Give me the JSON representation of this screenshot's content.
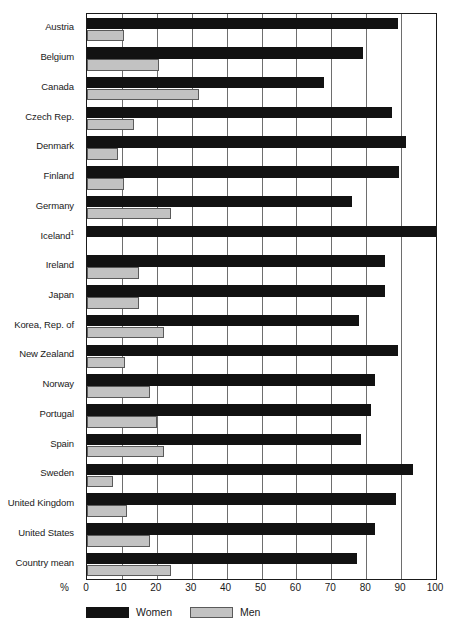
{
  "chart_data": {
    "type": "bar",
    "orientation": "horizontal",
    "title": "",
    "xlabel": "%",
    "ylabel": "",
    "xlim": [
      0,
      100
    ],
    "xticks": [
      0,
      10,
      20,
      30,
      40,
      50,
      60,
      70,
      80,
      90,
      100
    ],
    "xtick_labels": [
      "0",
      "10",
      "20",
      "30",
      "40",
      "50",
      "60",
      "70",
      "80",
      "90",
      "100"
    ],
    "grid": true,
    "legend_position": "bottom-left",
    "categories": [
      "Austria",
      "Belgium",
      "Canada",
      "Czech Rep.",
      "Denmark",
      "Finland",
      "Germany",
      "Iceland",
      "Ireland",
      "Japan",
      "Korea, Rep. of",
      "New Zealand",
      "Norway",
      "Portugal",
      "Spain",
      "Sweden",
      "United Kingdom",
      "United States",
      "Country mean"
    ],
    "category_footnotes": {
      "Iceland": "1"
    },
    "series": [
      {
        "name": "Women",
        "color": "#121212",
        "values": [
          89,
          79,
          68,
          87.5,
          91.5,
          89.5,
          76,
          100,
          85.5,
          85.5,
          78,
          89,
          82.5,
          81.5,
          78.5,
          93.5,
          88.5,
          82.5,
          77.5
        ]
      },
      {
        "name": "Men",
        "color": "#c2c2c2",
        "values": [
          10.5,
          20.5,
          32,
          13.5,
          9,
          10.5,
          24,
          0,
          15,
          15,
          22,
          11,
          18,
          20,
          22,
          7.5,
          11.5,
          18,
          24
        ]
      }
    ]
  },
  "legend": {
    "items": [
      {
        "label": "Women",
        "swatch": "women"
      },
      {
        "label": "Men",
        "swatch": "men"
      }
    ]
  },
  "axis": {
    "percent_symbol": "%"
  }
}
